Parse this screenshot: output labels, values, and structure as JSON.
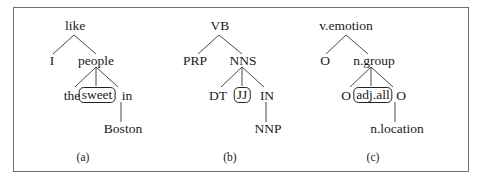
{
  "figure": {
    "trees": [
      {
        "caption": "(a)",
        "nodes": {
          "root": "like",
          "left": "I",
          "right": "people",
          "c1": "the",
          "c2": "sweet",
          "c3": "in",
          "leaf": "Boston"
        },
        "highlighted": "sweet"
      },
      {
        "caption": "(b)",
        "nodes": {
          "root": "VB",
          "left": "PRP",
          "right": "NNS",
          "c1": "DT",
          "c2": "JJ",
          "c3": "IN",
          "leaf": "NNP"
        },
        "highlighted": "JJ"
      },
      {
        "caption": "(c)",
        "nodes": {
          "root": "v.emotion",
          "left": "O",
          "right": "n.group",
          "c1": "O",
          "c2": "adj.all",
          "c3": "O",
          "leaf": "n.location"
        },
        "highlighted": "adj.all"
      }
    ]
  }
}
